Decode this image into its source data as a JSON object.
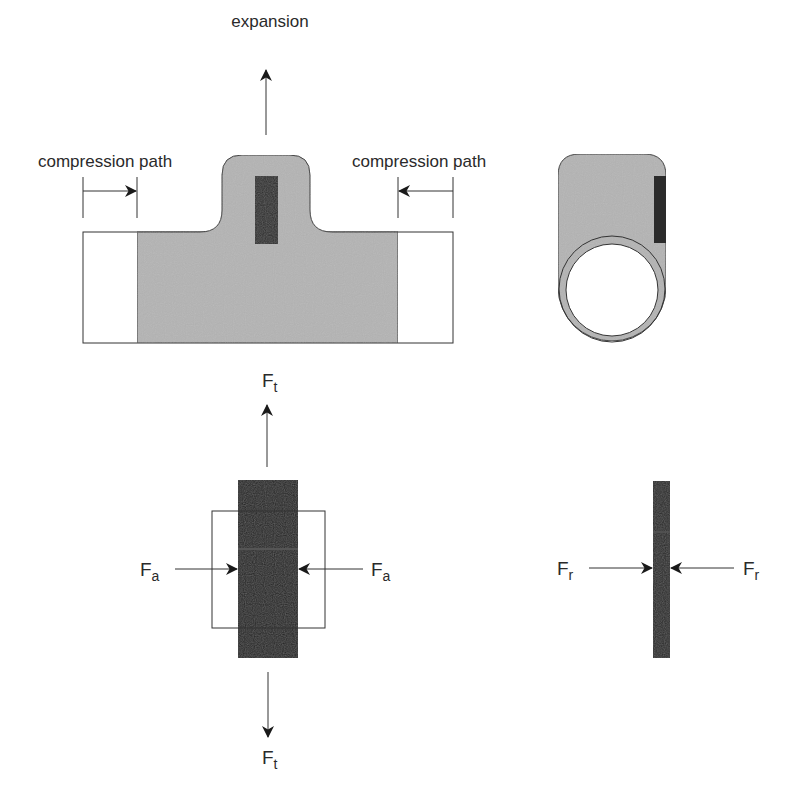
{
  "diagram": {
    "top_view": {
      "expansion_label": "expansion",
      "left_label": "compression path",
      "right_label": "compression path"
    },
    "force_view_left": {
      "top_force": {
        "symbol": "F",
        "subscript": "t"
      },
      "bottom_force": {
        "symbol": "F",
        "subscript": "t"
      },
      "left_force": {
        "symbol": "F",
        "subscript": "a"
      },
      "right_force": {
        "symbol": "F",
        "subscript": "a"
      }
    },
    "force_view_right": {
      "left_force": {
        "symbol": "F",
        "subscript": "r"
      },
      "right_force": {
        "symbol": "F",
        "subscript": "r"
      }
    },
    "colors": {
      "body_gray": "#b4b4b4",
      "strain_gauge_dark": "#2b2b2b",
      "outline": "#333333",
      "background": "#ffffff"
    }
  }
}
